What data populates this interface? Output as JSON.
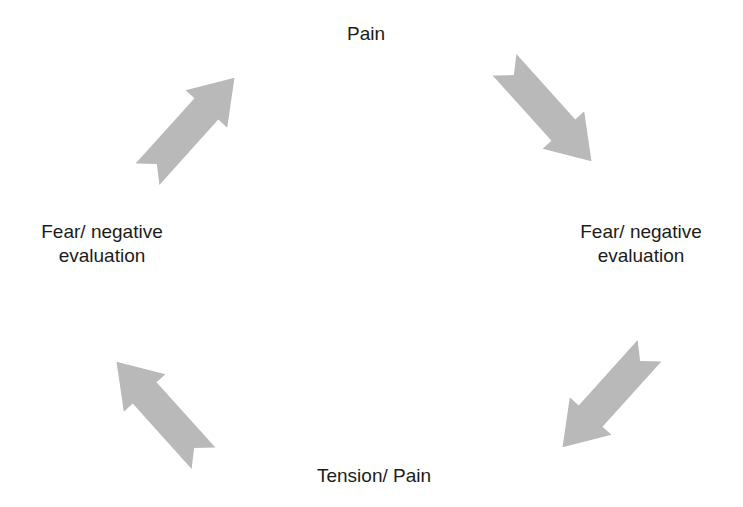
{
  "diagram": {
    "type": "cycle",
    "background_color": "#ffffff",
    "text_color": "#1c1c1c",
    "arrow_color": "#b9b9b9",
    "nodes": {
      "top": {
        "label": "Pain"
      },
      "right": {
        "line1": "Fear/ negative",
        "line2": "evaluation"
      },
      "bottom": {
        "label": "Tension/ Pain"
      },
      "left": {
        "line1": "Fear/ negative",
        "line2": "evaluation"
      }
    },
    "arrows": [
      {
        "name": "arrow-left-to-top",
        "direction": "up-right"
      },
      {
        "name": "arrow-top-to-right",
        "direction": "down-right"
      },
      {
        "name": "arrow-right-to-bottom",
        "direction": "down-left"
      },
      {
        "name": "arrow-bottom-to-left",
        "direction": "up-left"
      }
    ]
  }
}
